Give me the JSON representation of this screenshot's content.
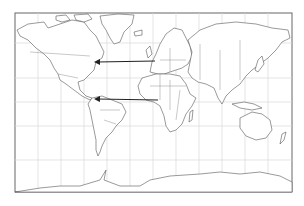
{
  "map": {
    "projection": "mercator",
    "graticule_step_deg": 30,
    "background_color": "#ffffff",
    "land_stroke_color": "#555555",
    "grid_color": "#d8d8d8",
    "arrow_color": "#222222",
    "arrows": [
      {
        "name": "europe-to-north-america",
        "from": "Western Europe",
        "to": "Northeastern North America",
        "direction": "westward"
      },
      {
        "name": "west-africa-to-caribbean",
        "from": "West Africa",
        "to": "Caribbean / Northern South America",
        "direction": "westward"
      }
    ]
  }
}
